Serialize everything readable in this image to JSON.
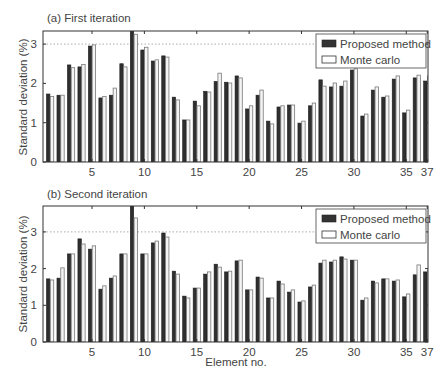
{
  "chart_data": [
    {
      "type": "bar",
      "title": "(a) First iteration",
      "xlabel": "",
      "ylabel": "Standard deviation (%)",
      "ylim": [
        0,
        3.33
      ],
      "yticks": [
        0,
        1,
        2,
        3
      ],
      "xticks": [
        5,
        10,
        15,
        20,
        25,
        30,
        35,
        37
      ],
      "grid": "dotted line at y=3",
      "legend_position": "upper right",
      "categories": [
        1,
        2,
        3,
        4,
        5,
        6,
        7,
        8,
        9,
        10,
        11,
        12,
        13,
        14,
        15,
        16,
        17,
        18,
        19,
        20,
        21,
        22,
        23,
        24,
        25,
        26,
        27,
        28,
        29,
        30,
        31,
        32,
        33,
        34,
        35,
        36,
        37
      ],
      "series": [
        {
          "name": "Proposed method",
          "color": "#2b2b2b",
          "values": [
            1.73,
            1.7,
            2.47,
            2.42,
            2.95,
            1.63,
            1.7,
            2.5,
            3.35,
            2.85,
            2.57,
            2.7,
            1.65,
            1.07,
            1.55,
            1.8,
            2.05,
            2.03,
            2.19,
            1.35,
            1.7,
            1.04,
            1.4,
            1.45,
            0.99,
            1.43,
            2.09,
            1.91,
            1.93,
            2.34,
            1.17,
            1.83,
            1.65,
            2.11,
            1.25,
            2.14,
            2.06
          ]
        },
        {
          "name": "Monte carlo",
          "color": "#ffffff",
          "values": [
            1.67,
            1.7,
            2.4,
            2.48,
            2.98,
            1.67,
            1.88,
            2.42,
            3.25,
            2.92,
            2.6,
            2.67,
            1.58,
            1.07,
            1.43,
            1.78,
            2.26,
            2.01,
            2.14,
            1.43,
            1.83,
            0.97,
            1.43,
            1.45,
            1.04,
            1.5,
            1.93,
            2.01,
            2.06,
            2.37,
            1.22,
            1.91,
            1.68,
            2.19,
            1.32,
            2.21,
            2.19
          ]
        }
      ]
    },
    {
      "type": "bar",
      "title": "(b) Second iteration",
      "xlabel": "Element no.",
      "ylabel": "Standard deviation (%)",
      "ylim": [
        0,
        3.7
      ],
      "yticks": [
        0,
        1,
        2,
        3
      ],
      "xticks": [
        5,
        10,
        15,
        20,
        25,
        30,
        35,
        37
      ],
      "grid": "dotted line at y=3",
      "legend_position": "upper right",
      "categories": [
        1,
        2,
        3,
        4,
        5,
        6,
        7,
        8,
        9,
        10,
        11,
        12,
        13,
        14,
        15,
        16,
        17,
        18,
        19,
        20,
        21,
        22,
        23,
        24,
        25,
        26,
        27,
        28,
        29,
        30,
        31,
        32,
        33,
        34,
        35,
        36,
        37
      ],
      "series": [
        {
          "name": "Proposed method",
          "color": "#2b2b2b",
          "values": [
            1.72,
            1.74,
            2.4,
            2.81,
            2.53,
            1.44,
            1.74,
            2.4,
            3.75,
            2.4,
            2.7,
            2.97,
            1.93,
            1.25,
            1.47,
            1.85,
            2.12,
            1.91,
            2.21,
            1.42,
            1.77,
            1.2,
            1.66,
            1.36,
            1.09,
            1.5,
            2.15,
            2.18,
            2.32,
            2.23,
            1.14,
            1.66,
            1.72,
            1.66,
            1.23,
            1.83,
            1.91
          ]
        },
        {
          "name": "Monte carlo",
          "color": "#ffffff",
          "values": [
            1.69,
            2.02,
            2.4,
            2.67,
            2.62,
            1.53,
            1.8,
            2.4,
            3.38,
            2.4,
            2.75,
            2.86,
            1.85,
            1.2,
            1.47,
            1.91,
            2.04,
            1.93,
            2.23,
            1.42,
            1.74,
            1.2,
            1.58,
            1.42,
            1.12,
            1.55,
            2.23,
            2.23,
            2.26,
            2.23,
            1.2,
            1.61,
            1.72,
            1.69,
            1.31,
            2.1,
            1.96
          ]
        }
      ]
    }
  ],
  "figure": {
    "panels": [
      {
        "title": "(a) First iteration",
        "ylabel": "Standard deviation (%)",
        "tick_labels_x": [
          "5",
          "10",
          "15",
          "20",
          "25",
          "30",
          "35",
          "37"
        ],
        "tick_labels_y": [
          "0",
          "1",
          "2",
          "3"
        ]
      },
      {
        "title": "(b) Second iteration",
        "ylabel": "Standard deviation (%)",
        "tick_labels_x": [
          "5",
          "10",
          "15",
          "20",
          "25",
          "30",
          "35",
          "37"
        ],
        "tick_labels_y": [
          "0",
          "1",
          "2",
          "3"
        ]
      }
    ],
    "xlabel": "Element no.",
    "legend": [
      {
        "label": "Proposed method",
        "swatch": "dark"
      },
      {
        "label": "Monte carlo",
        "swatch": "white"
      }
    ]
  }
}
